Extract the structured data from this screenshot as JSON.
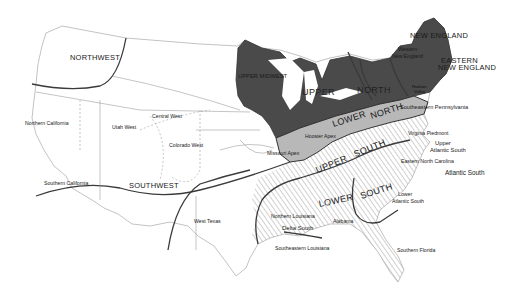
{
  "map": {
    "type": "dialect regions map of the contiguous United States",
    "colors": {
      "background": "#ffffff",
      "north_region": "#4a4a4a",
      "midland_region": "#b4b4b4",
      "south_hatch": "#6a6a6a",
      "border_heavy": "#333333",
      "border_light": "#9a9a9a"
    },
    "major_regions": {
      "northwest": "NORTHWEST",
      "southwest": "SOUTHWEST",
      "upper_midwest": "UPPER MIDWEST",
      "upper": "UPPER",
      "north": "NORTH",
      "new_england": "NEW ENGLAND",
      "eastern_new_england_1": "EASTERN",
      "eastern_new_england_2": "NEW ENGLAND",
      "lower_north_1": "LOWER",
      "lower_north_2": "NORTH",
      "upper_south_1": "UPPER",
      "upper_south_2": "SOUTH",
      "lower_south_1": "LOWER",
      "lower_south_2": "SOUTH"
    },
    "sub_regions": {
      "northern_california": "Northern California",
      "southern_california": "Southern California",
      "utah_west": "Utah West",
      "central_west": "Central West",
      "colorado_west": "Colorado West",
      "west_texas": "West Texas",
      "western_new_england_1": "Western",
      "western_new_england_2": "New England",
      "hudson_valley_1": "Hudson",
      "hudson_valley_2": "Valley",
      "southeastern_pennsylvania": "Southeastern Pennsylvania",
      "hoosier_apex": "Hoosier Apex",
      "missouri_apex": "Missouri Apex",
      "virginia_piedmont": "Virginia Piedmont",
      "upper_atlantic_south_1": "Upper",
      "upper_atlantic_south_2": "Atlantic South",
      "eastern_north_carolina": "Eastern North Carolina",
      "atlantic_south": "Atlantic South",
      "lower_atlantic_south_1": "Lower",
      "lower_atlantic_south_2": "Atlantic South",
      "northern_louisiana": "Northern Louisiana",
      "alabama": "Alabama",
      "delta_south": "Delta South",
      "southeastern_louisiana": "Southeastern Louisiana",
      "southern_florida": "Southern Florida"
    }
  }
}
